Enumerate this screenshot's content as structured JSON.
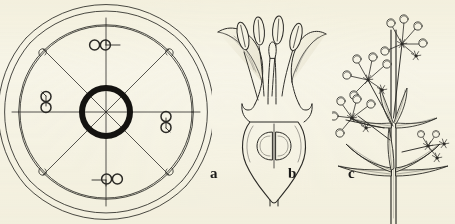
{
  "plate": {
    "background_color": "#f7f5e9",
    "ink_color": "#2b2a26",
    "accent_color": "#111111",
    "width": 455,
    "height": 224
  },
  "figures": [
    {
      "key": "a",
      "label": "a",
      "name": "floral-diagram",
      "description": "Floral diagram: four petals, four stamens, inferior ovary ring, tetramerous symmetry",
      "merosity": 4,
      "parts": {
        "ovary_label": "ovary-ring",
        "stamen_label": "stamen-symbol",
        "petal_label": "petal-outline",
        "sepal_label": "sepal-outline",
        "radius_label": "radius-line"
      },
      "stamen_positions": [
        "top",
        "left",
        "right",
        "bottom"
      ],
      "stamen_count": 4,
      "radius_count": 8
    },
    {
      "key": "b",
      "label": "b",
      "name": "flower-longitudinal-section",
      "description": "Longitudinal section of flower showing four stamens with anthers, style, stigma and two-locular inferior ovary with ovules",
      "parts": {
        "anther_label": "anther",
        "filament_label": "filament",
        "style_label": "style",
        "stigma_label": "stigma",
        "corolla_lobe_label": "corolla-lobe",
        "ovary_label": "ovary",
        "ovule_label": "ovule",
        "pedicel_label": "pedicel"
      },
      "anther_count": 4,
      "ovule_count": 2
    },
    {
      "key": "c",
      "label": "c",
      "name": "plant-habit",
      "description": "Habit sketch: erect quadrangular stem with whorled lanceolate leaves and terminal cymose inflorescence of small buds and flowers",
      "parts": {
        "stem_label": "stem",
        "leaf_whorl_label": "leaf-whorl",
        "inflorescence_label": "cyme",
        "bud_label": "flower-bud",
        "flower_label": "open-flower",
        "branch_label": "peduncle"
      },
      "leaf_whorl_count": 3,
      "cyme_count": 4
    }
  ],
  "labels": {
    "a": "a",
    "b": "b",
    "c": "c"
  }
}
